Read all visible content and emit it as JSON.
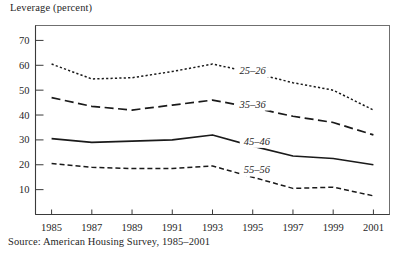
{
  "figure": {
    "axis_title": "Leverage (percent)",
    "source_note": "Source: American Housing Survey, 1985–2001"
  },
  "chart_data": {
    "type": "line",
    "title": "Leverage (percent)",
    "xlabel": "",
    "ylabel": "Leverage (percent)",
    "x": [
      1985,
      1987,
      1989,
      1991,
      1993,
      1995,
      1997,
      1999,
      2001
    ],
    "xtick_labels": [
      "1985",
      "1987",
      "1989",
      "1991",
      "1993",
      "1995",
      "1997",
      "1999",
      "2001"
    ],
    "ytick_labels": [
      "10",
      "20",
      "30",
      "40",
      "50",
      "60",
      "70"
    ],
    "yticks": [
      10,
      20,
      30,
      40,
      50,
      60,
      70
    ],
    "xlim": [
      1984.2,
      2001.8
    ],
    "ylim": [
      0,
      76
    ],
    "grid": false,
    "legend_position": "inline-right-of-lines",
    "series": [
      {
        "name": "25–26",
        "label": "25–26",
        "linestyle": "dotted",
        "values": [
          60.5,
          54.5,
          55.0,
          57.5,
          60.5,
          57.0,
          53.0,
          50.0,
          42.0
        ],
        "label_x": 1995.0,
        "label_y": 56.5
      },
      {
        "name": "35–36",
        "label": "35–36",
        "linestyle": "long-dash",
        "values": [
          47.0,
          43.5,
          42.0,
          44.0,
          46.0,
          43.0,
          39.5,
          37.0,
          32.0
        ],
        "label_x": 1995.0,
        "label_y": 43.0
      },
      {
        "name": "45–46",
        "label": "45–46",
        "linestyle": "solid",
        "values": [
          30.5,
          29.0,
          29.5,
          30.0,
          32.0,
          27.5,
          23.5,
          22.5,
          20.0
        ],
        "label_x": 1995.2,
        "label_y": 28.0
      },
      {
        "name": "55–56",
        "label": "55–56",
        "linestyle": "short-dash",
        "values": [
          20.5,
          19.0,
          18.5,
          18.5,
          19.5,
          15.0,
          10.5,
          11.0,
          7.5
        ],
        "label_x": 1995.2,
        "label_y": 16.5
      }
    ]
  }
}
